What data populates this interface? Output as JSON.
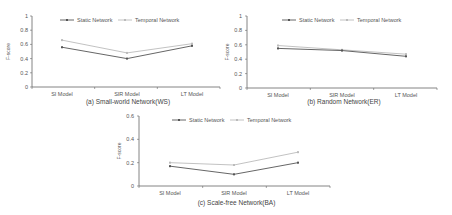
{
  "chart_data": [
    {
      "type": "line",
      "title": "(a) Small-world Network(WS)",
      "xlabel": "",
      "ylabel": "F-score",
      "categories": [
        "SI Model",
        "SIR Model",
        "LT Model"
      ],
      "ylim": [
        0,
        1
      ],
      "yticks": [
        "0",
        "0.2",
        "0.4",
        "0.6",
        "0.8",
        "1"
      ],
      "series": [
        {
          "name": "Static Network",
          "values": [
            0.56,
            0.4,
            0.58
          ],
          "color": "#555555"
        },
        {
          "name": "Temporal Network",
          "values": [
            0.66,
            0.48,
            0.61
          ],
          "color": "#bbbbbb"
        }
      ],
      "legend_position": "top",
      "grid": false
    },
    {
      "type": "line",
      "title": "(b) Random Network(ER)",
      "xlabel": "",
      "ylabel": "F-score",
      "categories": [
        "SI Model",
        "SIR Model",
        "LT Model"
      ],
      "ylim": [
        0,
        1
      ],
      "yticks": [
        "0",
        "0.2",
        "0.4",
        "0.6",
        "0.8",
        "1"
      ],
      "series": [
        {
          "name": "Static Network",
          "values": [
            0.55,
            0.52,
            0.44
          ],
          "color": "#555555"
        },
        {
          "name": "Temporal Network",
          "values": [
            0.59,
            0.53,
            0.47
          ],
          "color": "#bbbbbb"
        }
      ],
      "legend_position": "top",
      "grid": false
    },
    {
      "type": "line",
      "title": "(c) Scale-free Network(BA)",
      "xlabel": "",
      "ylabel": "F-score",
      "categories": [
        "SI Model",
        "SIR Model",
        "LT Model"
      ],
      "ylim": [
        0,
        0.6
      ],
      "yticks": [
        "0",
        "0.2",
        "0.4",
        "0.6"
      ],
      "series": [
        {
          "name": "Static Network",
          "values": [
            0.17,
            0.1,
            0.2
          ],
          "color": "#555555"
        },
        {
          "name": "Temporal Network",
          "values": [
            0.2,
            0.18,
            0.29
          ],
          "color": "#bbbbbb"
        }
      ],
      "legend_position": "top",
      "grid": false
    }
  ]
}
